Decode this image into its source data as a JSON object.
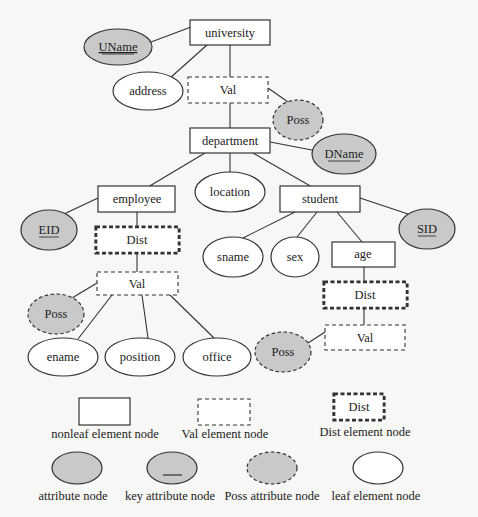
{
  "diagram": {
    "type": "XML schema tree with attribute/element node notation",
    "nodes": {
      "university": {
        "label": "university",
        "kind": "nonleaf"
      },
      "uname": {
        "label": "UName",
        "kind": "key-attribute"
      },
      "address": {
        "label": "address",
        "kind": "leaf"
      },
      "val_univ": {
        "label": "Val",
        "kind": "val"
      },
      "poss_univ": {
        "label": "Poss",
        "kind": "poss-attribute"
      },
      "department": {
        "label": "department",
        "kind": "nonleaf"
      },
      "dname": {
        "label": "DName",
        "kind": "key-attribute"
      },
      "location": {
        "label": "location",
        "kind": "leaf"
      },
      "employee": {
        "label": "employee",
        "kind": "nonleaf"
      },
      "eid": {
        "label": "EID",
        "kind": "key-attribute"
      },
      "dist_emp": {
        "label": "Dist",
        "kind": "dist"
      },
      "val_emp": {
        "label": "Val",
        "kind": "val"
      },
      "poss_emp": {
        "label": "Poss",
        "kind": "poss-attribute"
      },
      "ename": {
        "label": "ename",
        "kind": "leaf"
      },
      "position": {
        "label": "position",
        "kind": "leaf"
      },
      "office": {
        "label": "office",
        "kind": "leaf"
      },
      "student": {
        "label": "student",
        "kind": "nonleaf"
      },
      "sid": {
        "label": "SID",
        "kind": "key-attribute"
      },
      "sname": {
        "label": "sname",
        "kind": "leaf"
      },
      "sex": {
        "label": "sex",
        "kind": "leaf"
      },
      "age": {
        "label": "age",
        "kind": "nonleaf"
      },
      "dist_age": {
        "label": "Dist",
        "kind": "dist"
      },
      "val_age": {
        "label": "Val",
        "kind": "val"
      },
      "poss_age": {
        "label": "Poss",
        "kind": "poss-attribute"
      }
    },
    "edges": [
      [
        "university",
        "uname"
      ],
      [
        "university",
        "address"
      ],
      [
        "university",
        "val_univ"
      ],
      [
        "val_univ",
        "poss_univ"
      ],
      [
        "val_univ",
        "department"
      ],
      [
        "department",
        "dname"
      ],
      [
        "department",
        "employee"
      ],
      [
        "department",
        "location"
      ],
      [
        "department",
        "student"
      ],
      [
        "employee",
        "eid"
      ],
      [
        "employee",
        "dist_emp"
      ],
      [
        "dist_emp",
        "val_emp"
      ],
      [
        "val_emp",
        "poss_emp"
      ],
      [
        "val_emp",
        "ename"
      ],
      [
        "val_emp",
        "position"
      ],
      [
        "val_emp",
        "office"
      ],
      [
        "student",
        "sid"
      ],
      [
        "student",
        "sname"
      ],
      [
        "student",
        "sex"
      ],
      [
        "student",
        "age"
      ],
      [
        "age",
        "dist_age"
      ],
      [
        "dist_age",
        "val_age"
      ],
      [
        "val_age",
        "poss_age"
      ]
    ]
  },
  "legend": {
    "nonleaf": {
      "label": "nonleaf element node"
    },
    "val": {
      "label": "Val element node"
    },
    "dist": {
      "label": "Dist element node",
      "glyph": "Dist"
    },
    "attribute": {
      "label": "attribute node"
    },
    "key_attribute": {
      "label": "key attribute node"
    },
    "poss_attribute": {
      "label": "Poss attribute node"
    },
    "leaf": {
      "label": "leaf element node"
    }
  },
  "colors": {
    "attribute_fill": "#c9c9c9",
    "stroke": "#333333",
    "background": "#f7f7f5"
  }
}
